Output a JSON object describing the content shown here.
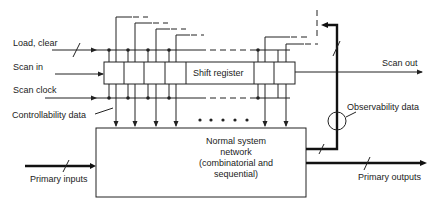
{
  "diagram": {
    "labels": {
      "load_clear": "Load, clear",
      "scan_in": "Scan in",
      "scan_clock": "Scan clock",
      "controllability": "Controllability data",
      "shift_register": "Shift register",
      "scan_out": "Scan out",
      "observability": "Observability data",
      "network_line1": "Normal system",
      "network_line2": "network",
      "network_line3": "(combinatorial and",
      "network_line4": "sequential)",
      "primary_inputs": "Primary inputs",
      "primary_outputs": "Primary outputs"
    },
    "shift_register_cells_left": 4,
    "shift_register_cells_right": 2,
    "ellipsis_dots": 5,
    "colors": {
      "stroke": "#222222",
      "background": "#ffffff"
    }
  }
}
